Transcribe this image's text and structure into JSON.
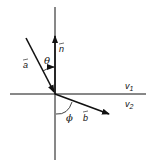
{
  "diagram": {
    "type": "vector-refraction-diagram",
    "labels": {
      "vector_a": "a",
      "vector_n": "n",
      "vector_b": "b",
      "angle_theta": "θ",
      "angle_phi": "ϕ",
      "medium_1": "v",
      "medium_1_sub": "1",
      "medium_2": "v",
      "medium_2_sub": "2"
    },
    "colors": {
      "stroke": "#111111",
      "background": "#ffffff"
    }
  }
}
